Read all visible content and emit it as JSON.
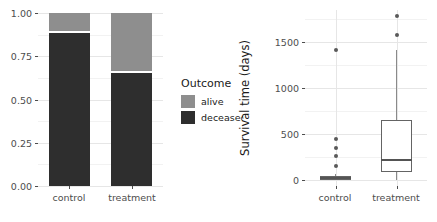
{
  "figure": {
    "width": 437,
    "height": 222,
    "background": "#ffffff"
  },
  "colors": {
    "alive": "#8e8e8e",
    "deceased": "#2e2e2e",
    "grid_major": "#e6e6e6",
    "grid_minor": "#f2f2f2",
    "box_stroke": "#646464",
    "outlier": "#595959",
    "text": "#1a1a1a",
    "tick_text": "#4d4d4d"
  },
  "legend": {
    "title": "Outcome",
    "items": [
      {
        "label": "alive",
        "color": "#8e8e8e"
      },
      {
        "label": "deceased",
        "color": "#2e2e2e"
      }
    ]
  },
  "chart_data": [
    {
      "id": "stacked-proportion-bar",
      "type": "bar",
      "title": "",
      "xlabel": "",
      "ylabel": "",
      "stacked": true,
      "normalized": true,
      "grid": true,
      "legend_position": "right",
      "legend_title": "Outcome",
      "categories": [
        "control",
        "treatment"
      ],
      "ylim": [
        0.0,
        1.0
      ],
      "yticks": [
        0.0,
        0.25,
        0.5,
        0.75,
        1.0
      ],
      "ytick_labels": [
        "0.00",
        "0.25",
        "0.50",
        "0.75",
        "1.00"
      ],
      "series": [
        {
          "name": "deceased",
          "color": "#2e2e2e",
          "values": [
            0.885,
            0.655
          ]
        },
        {
          "name": "alive",
          "color": "#8e8e8e",
          "values": [
            0.115,
            0.345
          ]
        }
      ]
    },
    {
      "id": "survival-time-boxplot",
      "type": "box",
      "title": "",
      "xlabel": "",
      "ylabel": "Survival time (days)",
      "grid": true,
      "legend_position": "none",
      "categories": [
        "control",
        "treatment"
      ],
      "ylim": [
        -70,
        1850
      ],
      "yticks": [
        0,
        500,
        1000,
        1500
      ],
      "ytick_labels": [
        "0",
        "500",
        "1000",
        "1500"
      ],
      "boxes": [
        {
          "name": "control",
          "min_whisker": 0,
          "q1": 0,
          "median": 14,
          "q3": 35,
          "max_whisker": 60,
          "outliers": [
            150,
            260,
            345,
            445,
            1410
          ]
        },
        {
          "name": "treatment",
          "min_whisker": 0,
          "q1": 80,
          "median": 215,
          "q3": 650,
          "max_whisker": 1415,
          "outliers": [
            1575,
            1790
          ]
        }
      ]
    }
  ]
}
